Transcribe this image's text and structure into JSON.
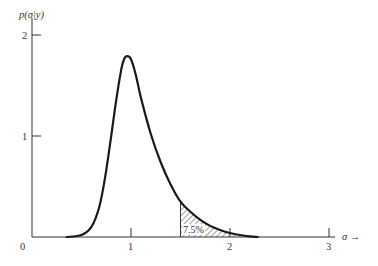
{
  "chart_data": {
    "type": "line",
    "title": "",
    "xlabel": "σ →",
    "ylabel": "p(σ|y)",
    "xlim": [
      0,
      3.4
    ],
    "ylim": [
      0,
      2.1
    ],
    "grid": false,
    "x_ticks": [
      {
        "value": 0,
        "label": "0"
      },
      {
        "value": 1,
        "label": "1"
      },
      {
        "value": 2,
        "label": "2"
      },
      {
        "value": 3,
        "label": "3"
      }
    ],
    "y_ticks": [
      {
        "value": 1,
        "label": "1"
      },
      {
        "value": 2,
        "label": "2"
      }
    ],
    "series": [
      {
        "name": "posterior density p(σ|y)",
        "x": [
          0.35,
          0.5,
          0.6,
          0.68,
          0.74,
          0.8,
          0.85,
          0.9,
          0.93,
          0.96,
          1.0,
          1.05,
          1.1,
          1.2,
          1.3,
          1.4,
          1.5,
          1.6,
          1.7,
          1.8,
          1.9,
          2.0,
          2.1,
          2.2,
          2.28
        ],
        "y": [
          0.0,
          0.02,
          0.1,
          0.3,
          0.6,
          1.0,
          1.35,
          1.65,
          1.76,
          1.79,
          1.76,
          1.6,
          1.38,
          1.02,
          0.74,
          0.52,
          0.35,
          0.25,
          0.17,
          0.11,
          0.07,
          0.04,
          0.02,
          0.006,
          0.0
        ]
      }
    ],
    "shaded_region": {
      "x_start": 1.5,
      "x_end": 2.28,
      "pattern": "diagonal-hatch",
      "label": "7.5%"
    },
    "annotations": [
      "7.5%"
    ]
  },
  "axes": {
    "y_label_main": "p(σ|y)",
    "x_label_main": "σ →",
    "origin_label": "0"
  }
}
